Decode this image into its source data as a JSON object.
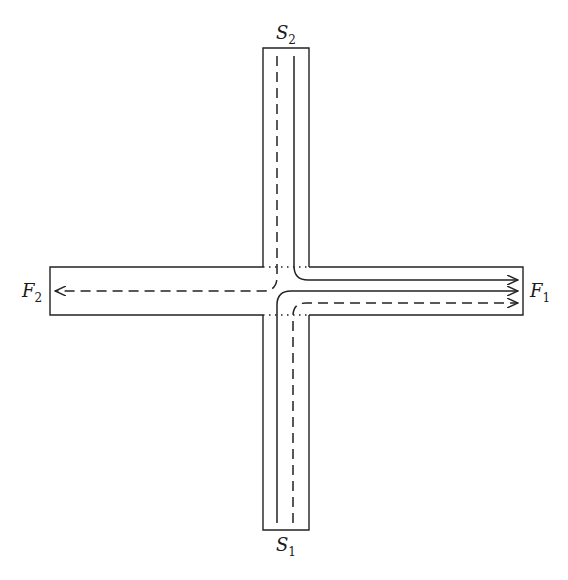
{
  "diagram": {
    "type": "cross-channel flow diagram",
    "labels": {
      "s1": {
        "main": "S",
        "sub": "1"
      },
      "s2": {
        "main": "S",
        "sub": "2"
      },
      "f1": {
        "main": "F",
        "sub": "1"
      },
      "f2": {
        "main": "F",
        "sub": "2"
      }
    },
    "channels": {
      "vertical": {
        "x": [
          263,
          309
        ],
        "y": [
          48,
          530
        ]
      },
      "horizontal": {
        "x": [
          50,
          523
        ],
        "y": [
          267,
          315
        ]
      }
    },
    "flows": [
      {
        "from": "S2",
        "to": "F1",
        "style": "solid"
      },
      {
        "from": "S1",
        "to": "F1",
        "style": "solid"
      },
      {
        "from": "S1",
        "to": "F1",
        "style": "dashed"
      },
      {
        "from": "S2",
        "to": "F2",
        "style": "dashed"
      }
    ],
    "colors": {
      "stroke": "#222222",
      "background": "#ffffff"
    }
  }
}
